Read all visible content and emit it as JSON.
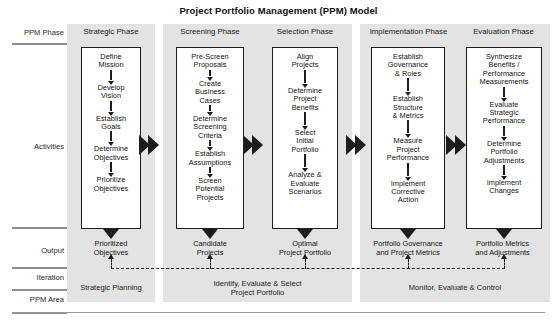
{
  "title": "Project Portfolio Management (PPM) Model",
  "row_labels": {
    "ppm_phase": "PPM Phase",
    "activities": "Activities",
    "output": "Output",
    "iteration": "Iteration",
    "ppm_area": "PPM Area"
  },
  "phases": [
    {
      "id": "strategic",
      "heading": "Strategic\nPhase",
      "activities": [
        "Define\nMission",
        "Develop\nVision",
        "Establish\nGoals",
        "Determine\nObjectives",
        "Prioritize\nObjectives"
      ],
      "output": "Prioritized\nObjectives"
    },
    {
      "id": "screening",
      "heading": "Screening\nPhase",
      "activities": [
        "Pre-Screen\nProposals",
        "Create\nBusiness\nCases",
        "Determine\nScreening\nCriteria",
        "Establish\nAssumptions",
        "Screen\nPotential\nProjects"
      ],
      "output": "Candidate\nProjects"
    },
    {
      "id": "selection",
      "heading": "Selection\nPhase",
      "activities": [
        "Align\nProjects",
        "Determine\nProject\nBenefits",
        "Select\nInitial\nPortfolio",
        "Analyze &\nEvaluate\nScenarios"
      ],
      "output": "Optimal\nProject Portfolio"
    },
    {
      "id": "implementation",
      "heading": "Implementation\nPhase",
      "activities": [
        "Establish\nGovernance\n& Roles",
        "Establish\nStructure\n& Metrics",
        "Measure\nProject\nPerformance",
        "Implement\nCorrective\nAction"
      ],
      "output": "Portfolio Governance\nand Project Metrics"
    },
    {
      "id": "evaluation",
      "heading": "Evaluation\nPhase",
      "activities": [
        "Synthesize\nBenefits /\nPerformance\nMeasurements",
        "Evaluate\nStrategic\nPerformance",
        "Determine\nPortfolio\nAdjustments",
        "Implement\nChanges"
      ],
      "output": "Portfolio Metrics\nand Adjustments"
    }
  ],
  "ppm_areas": [
    {
      "id": "strategic-planning",
      "label": "Strategic Planning"
    },
    {
      "id": "identify-evaluate-select",
      "label": "Identify, Evaluate & Select\nProject Portfolio"
    },
    {
      "id": "monitor-evaluate-control",
      "label": "Monitor, Evaluate & Control"
    }
  ],
  "colors": {
    "panel_gray": "#e3e3e3",
    "ink": "#1d1d1d",
    "rule": "#8d8d8d",
    "box_fill": "#ffffff"
  }
}
